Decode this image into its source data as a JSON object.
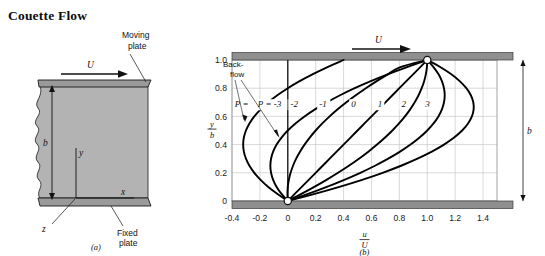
{
  "page": {
    "title": "Couette Flow"
  },
  "figure_a": {
    "caption": "(a)",
    "labels": {
      "moving_plate": "Moving\nplate",
      "moving_plate_line1": "Moving",
      "moving_plate_line2": "plate",
      "fixed_plate_line1": "Fixed",
      "fixed_plate_line2": "plate",
      "velocity": "U",
      "gap": "b",
      "axis_y": "y",
      "axis_x": "x",
      "axis_z": "z"
    },
    "colors": {
      "fluid_fill": "#b3b3b3",
      "plate_fill": "#9a9a9a",
      "stroke": "#1a1a1a"
    }
  },
  "figure_b": {
    "caption": "(b)",
    "labels": {
      "velocity": "U",
      "gap": "b",
      "backflow_line1": "Back-",
      "backflow_line2": "flow",
      "p_prefix": "P =",
      "xlabel_num": "u",
      "xlabel_den": "U",
      "ylabel_num": "y",
      "ylabel_den": "b"
    },
    "colors": {
      "plate_fill": "#8f8f8f",
      "grid": "#c8c8c8",
      "curve": "#000000",
      "marker_fill": "#ffffff"
    }
  },
  "chart_data": {
    "type": "line",
    "title": "Couette Flow",
    "subtitle": "",
    "xlabel": "u/U",
    "ylabel": "y/b",
    "xlim": [
      -0.4,
      1.5
    ],
    "ylim": [
      0.0,
      1.0
    ],
    "xticks": [
      "-0.4",
      "-0.2",
      "0",
      "0.2",
      "0.4",
      "0.6",
      "0.8",
      "1.0",
      "1.2",
      "1.4"
    ],
    "xtick_values": [
      -0.4,
      -0.2,
      0,
      0.2,
      0.4,
      0.6,
      0.8,
      1.0,
      1.2,
      1.4
    ],
    "yticks": [
      "0",
      "0.2",
      "0.4",
      "0.6",
      "0.8",
      "1.0"
    ],
    "ytick_values": [
      0,
      0.2,
      0.4,
      0.6,
      0.8,
      1.0
    ],
    "grid": true,
    "legend_position": "inline-curve-labels",
    "equation": "u/U = (y/b) + P (y/b)(1 - y/b)",
    "annotations": [
      {
        "text": "Back-flow",
        "target": "P = -3 and P = -2 curves",
        "x": -0.3,
        "y": 0.78
      },
      {
        "text": "U",
        "target": "moving top plate velocity arrow",
        "x": 0.65,
        "y": 1.12
      },
      {
        "text": "b",
        "target": "gap height dimension at right",
        "x": 1.58,
        "y": 0.5
      }
    ],
    "series": [
      {
        "name": "P = -3",
        "label": "P = -3",
        "P": -3,
        "label_x": -0.215,
        "label_y": 0.665,
        "points": [
          [
            0,
            0
          ],
          [
            -0.0735,
            0.05
          ],
          [
            -0.14,
            0.1
          ],
          [
            -0.195,
            0.15
          ],
          [
            -0.24,
            0.2
          ],
          [
            -0.275,
            0.25
          ],
          [
            -0.3,
            0.3
          ],
          [
            -0.315,
            0.35
          ],
          [
            -0.32,
            0.4
          ],
          [
            -0.315,
            0.45
          ],
          [
            -0.3,
            0.5
          ],
          [
            -0.275,
            0.55
          ],
          [
            -0.24,
            0.6
          ],
          [
            -0.195,
            0.65
          ],
          [
            -0.14,
            0.7
          ],
          [
            -0.075,
            0.75
          ],
          [
            0,
            0.8
          ],
          [
            0.085,
            0.85
          ],
          [
            0.18,
            0.9
          ],
          [
            0.285,
            0.95
          ],
          [
            0.4,
            1.0
          ]
        ]
      },
      {
        "name": "P = -2",
        "label": "-2",
        "P": -2,
        "label_x": 0.02,
        "label_y": 0.665,
        "points": [
          [
            0,
            0
          ],
          [
            -0.045,
            0.05
          ],
          [
            -0.08,
            0.1
          ],
          [
            -0.105,
            0.15
          ],
          [
            -0.12,
            0.2
          ],
          [
            -0.125,
            0.25
          ],
          [
            -0.12,
            0.3
          ],
          [
            -0.105,
            0.35
          ],
          [
            -0.08,
            0.4
          ],
          [
            -0.045,
            0.45
          ],
          [
            0,
            0.5
          ],
          [
            0.055,
            0.55
          ],
          [
            0.12,
            0.6
          ],
          [
            0.195,
            0.65
          ],
          [
            0.28,
            0.7
          ],
          [
            0.375,
            0.75
          ],
          [
            0.48,
            0.8
          ],
          [
            0.595,
            0.85
          ],
          [
            0.72,
            0.9
          ],
          [
            0.855,
            0.95
          ],
          [
            1.0,
            1.0
          ]
        ]
      },
      {
        "name": "P = -1",
        "label": "-1",
        "P": -1,
        "label_x": 0.225,
        "label_y": 0.665,
        "points": [
          [
            0,
            0
          ],
          [
            -0.0025,
            0.05
          ],
          [
            0,
            0.1
          ],
          [
            0.0075,
            0.15
          ],
          [
            0.02,
            0.2
          ],
          [
            0.0375,
            0.25
          ],
          [
            0.06,
            0.3
          ],
          [
            0.0875,
            0.35
          ],
          [
            0.12,
            0.4
          ],
          [
            0.1575,
            0.45
          ],
          [
            0.2,
            0.5
          ],
          [
            0.2475,
            0.55
          ],
          [
            0.3,
            0.6
          ],
          [
            0.3575,
            0.65
          ],
          [
            0.42,
            0.7
          ],
          [
            0.4875,
            0.75
          ],
          [
            0.56,
            0.8
          ],
          [
            0.6375,
            0.85
          ],
          [
            0.72,
            0.9
          ],
          [
            0.8075,
            0.95
          ],
          [
            1.0,
            1.0
          ]
        ]
      },
      {
        "name": "P = 0",
        "label": "0",
        "P": 0,
        "label_x": 0.455,
        "label_y": 0.665,
        "points": [
          [
            0,
            0
          ],
          [
            0.05,
            0.05
          ],
          [
            0.1,
            0.1
          ],
          [
            0.15,
            0.15
          ],
          [
            0.2,
            0.2
          ],
          [
            0.25,
            0.25
          ],
          [
            0.3,
            0.3
          ],
          [
            0.35,
            0.35
          ],
          [
            0.4,
            0.4
          ],
          [
            0.45,
            0.45
          ],
          [
            0.5,
            0.5
          ],
          [
            0.55,
            0.55
          ],
          [
            0.6,
            0.6
          ],
          [
            0.65,
            0.65
          ],
          [
            0.7,
            0.7
          ],
          [
            0.75,
            0.75
          ],
          [
            0.8,
            0.8
          ],
          [
            0.85,
            0.85
          ],
          [
            0.9,
            0.9
          ],
          [
            0.95,
            0.95
          ],
          [
            1.0,
            1.0
          ]
        ]
      },
      {
        "name": "P = 1",
        "label": "1",
        "P": 1,
        "label_x": 0.645,
        "label_y": 0.665,
        "points": [
          [
            0,
            0
          ],
          [
            0.0975,
            0.05
          ],
          [
            0.19,
            0.1
          ],
          [
            0.2775,
            0.15
          ],
          [
            0.36,
            0.2
          ],
          [
            0.4375,
            0.25
          ],
          [
            0.51,
            0.3
          ],
          [
            0.5775,
            0.35
          ],
          [
            0.64,
            0.4
          ],
          [
            0.6975,
            0.45
          ],
          [
            0.75,
            0.5
          ],
          [
            0.7975,
            0.55
          ],
          [
            0.84,
            0.6
          ],
          [
            0.8775,
            0.65
          ],
          [
            0.91,
            0.7
          ],
          [
            0.9375,
            0.75
          ],
          [
            0.96,
            0.8
          ],
          [
            0.9775,
            0.85
          ],
          [
            0.99,
            0.9
          ],
          [
            0.9975,
            0.95
          ],
          [
            1.0,
            1.0
          ]
        ]
      },
      {
        "name": "P = 2",
        "label": "2",
        "P": 2,
        "label_x": 0.815,
        "label_y": 0.665,
        "points": [
          [
            0,
            0
          ],
          [
            0.145,
            0.05
          ],
          [
            0.28,
            0.1
          ],
          [
            0.405,
            0.15
          ],
          [
            0.52,
            0.2
          ],
          [
            0.625,
            0.25
          ],
          [
            0.72,
            0.3
          ],
          [
            0.805,
            0.35
          ],
          [
            0.88,
            0.4
          ],
          [
            0.945,
            0.45
          ],
          [
            1.0,
            0.5
          ],
          [
            1.045,
            0.55
          ],
          [
            1.08,
            0.6
          ],
          [
            1.105,
            0.65
          ],
          [
            1.12,
            0.7
          ],
          [
            1.125,
            0.75
          ],
          [
            1.12,
            0.8
          ],
          [
            1.105,
            0.85
          ],
          [
            1.08,
            0.9
          ],
          [
            1.045,
            0.95
          ],
          [
            1.0,
            1.0
          ]
        ]
      },
      {
        "name": "P = 3",
        "label": "3",
        "P": 3,
        "label_x": 0.985,
        "label_y": 0.665,
        "points": [
          [
            0,
            0
          ],
          [
            0.1925,
            0.05
          ],
          [
            0.37,
            0.1
          ],
          [
            0.5325,
            0.15
          ],
          [
            0.68,
            0.2
          ],
          [
            0.8125,
            0.25
          ],
          [
            0.93,
            0.3
          ],
          [
            1.0325,
            0.35
          ],
          [
            1.12,
            0.4
          ],
          [
            1.1925,
            0.45
          ],
          [
            1.25,
            0.5
          ],
          [
            1.2925,
            0.55
          ],
          [
            1.32,
            0.6
          ],
          [
            1.3325,
            0.65
          ],
          [
            1.33,
            0.7
          ],
          [
            1.3125,
            0.75
          ],
          [
            1.28,
            0.8
          ],
          [
            1.2325,
            0.85
          ],
          [
            1.17,
            0.9
          ],
          [
            1.0925,
            0.95
          ],
          [
            1.0,
            1.0
          ]
        ]
      }
    ],
    "markers": [
      {
        "x": 0.0,
        "y": 0.0,
        "style": "open-circle"
      },
      {
        "x": 1.0,
        "y": 1.0,
        "style": "open-circle"
      }
    ]
  }
}
